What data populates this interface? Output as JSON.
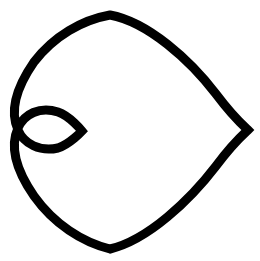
{
  "canvas": {
    "width": 260,
    "height": 261,
    "background_color": "#ffffff",
    "title": "Heart Outline"
  },
  "graphic": {
    "name": "heart-outline-icon",
    "semantic_icon": "heart-icon",
    "description": "Black outlined heart rotated 90 degrees clockwise, point facing right",
    "stroke_color": "#000000",
    "fill": "none",
    "stroke_width": 9,
    "rotation_degrees": 90,
    "bounding_box": {
      "left": 15,
      "top": 14,
      "right": 248,
      "bottom": 250
    },
    "key_points": {
      "tip": {
        "x": 248,
        "y": 130
      },
      "cleft": {
        "x": 82,
        "y": 131
      },
      "upper_lobe_leftmost": {
        "x": 16,
        "y": 90
      },
      "lower_lobe_leftmost": {
        "x": 16,
        "y": 172
      },
      "topmost": {
        "x": 100,
        "y": 15
      },
      "bottommost": {
        "x": 100,
        "y": 249
      }
    },
    "path": "M 82 131 C 82 131 70 116 58 112 C 40 106 24 114 18 128 C 10 146 16 170 34 196 C 54 224 82 242 110 249 C 148 240 190 200 216 166 C 234 142 246 132 248 130 C 246 128 234 118 216 94 C 190 60 148 22 110 15 C 82 20 54 36 34 62 C 16 88 10 112 18 130 C 24 144 40 152 58 148 C 70 144 82 131 82 131 Z"
  }
}
